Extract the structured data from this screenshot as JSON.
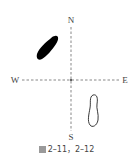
{
  "compass": {
    "north": "N",
    "south": "S",
    "west": "W",
    "east": "E"
  },
  "shapes": [
    {
      "name": "filled-footprint",
      "position": "upper-left (NW quadrant)",
      "fill": "#000000"
    },
    {
      "name": "outline-footprint",
      "position": "lower-right (SE quadrant)",
      "fill": "none",
      "stroke": "#222222"
    }
  ],
  "caption": {
    "prefix": "图",
    "text": "2–11，2–12"
  },
  "colors": {
    "axis": "#555555",
    "background": "#ffffff"
  }
}
